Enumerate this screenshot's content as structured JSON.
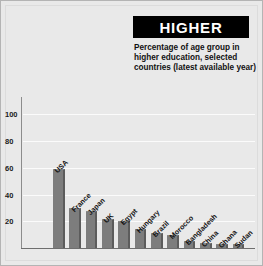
{
  "title": "HIGHER",
  "caption": "Percentage of age group in higher education, selected countries (latest available year)",
  "colors": {
    "background": "#e9e9e9",
    "title_box": "#000000",
    "title_text": "#ffffff",
    "bar": "#7d7d7d",
    "bar_shadow": "#5c5c5c",
    "gridline": "#fbfbfb",
    "axis": "#6e6e6e"
  },
  "chart_data": {
    "type": "bar",
    "title": "HIGHER",
    "subtitle": "Percentage of age group in higher education, selected countries (latest available year)",
    "xlabel": "",
    "ylabel": "",
    "ylim": [
      0,
      110
    ],
    "yticks": [
      20,
      40,
      60,
      80,
      100
    ],
    "grid": true,
    "legend": "none",
    "orientation": "vertical",
    "categories": [
      "USA",
      "France",
      "Japan",
      "UK",
      "Egypt",
      "Hungary",
      "Brazil",
      "Morocco",
      "Bangladesh",
      "China",
      "Ghana",
      "Sudan"
    ],
    "values": [
      59,
      30,
      28,
      22,
      20,
      14,
      11,
      10,
      5,
      3.5,
      3,
      3
    ]
  }
}
